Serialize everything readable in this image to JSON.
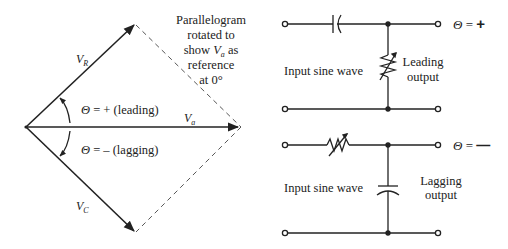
{
  "phasor_diagram": {
    "vectors": {
      "vr": {
        "label": "V",
        "sub": "R"
      },
      "va": {
        "label": "V",
        "sub": "a"
      },
      "vc": {
        "label": "V",
        "sub": "C"
      }
    },
    "leading_label": {
      "theta": "Θ",
      "text": " = + (leading)"
    },
    "lagging_label": {
      "theta": "Θ",
      "text": " = – (lagging)"
    },
    "note": {
      "line1": "Parallelogram",
      "line2": "rotated to",
      "line3_pre": "show ",
      "line3_v": "V",
      "line3_sub": "a",
      "line3_post": " as",
      "line4": "reference",
      "line5": "at 0°"
    }
  },
  "leading_circuit": {
    "input_label": "Input sine wave",
    "output_label_1": "Leading",
    "output_label_2": "output",
    "theta": "Θ",
    "sign": " = ",
    "sign_symbol": "+",
    "series_component": "capacitor",
    "shunt_component": "variable-resistor"
  },
  "lagging_circuit": {
    "input_label": "Input sine wave",
    "output_label_1": "Lagging",
    "output_label_2": "output",
    "theta": "Θ",
    "sign": " = ",
    "sign_symbol": "—",
    "series_component": "variable-resistor",
    "shunt_component": "capacitor"
  }
}
